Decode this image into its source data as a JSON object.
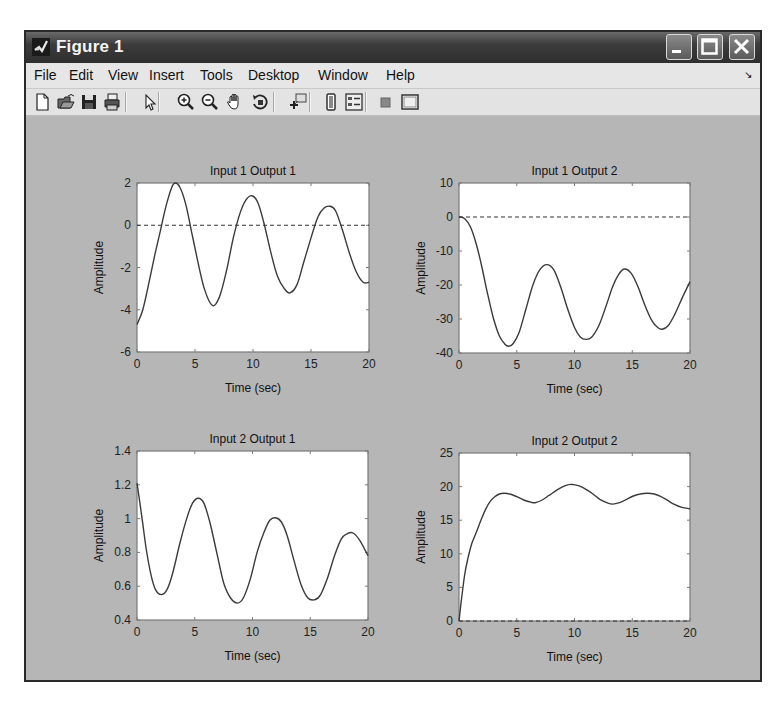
{
  "window": {
    "title": "Figure 1",
    "buttons": {
      "minimize": "minimize",
      "maximize": "maximize",
      "close": "close"
    }
  },
  "menubar": {
    "items": [
      {
        "label": "File",
        "x": 10
      },
      {
        "label": "Edit",
        "x": 45
      },
      {
        "label": "View",
        "x": 84
      },
      {
        "label": "Insert",
        "x": 125
      },
      {
        "label": "Tools",
        "x": 176
      },
      {
        "label": "Desktop",
        "x": 224
      },
      {
        "label": "Window",
        "x": 294
      },
      {
        "label": "Help",
        "x": 362
      }
    ]
  },
  "toolbar": {
    "buttons": [
      {
        "name": "new-figure-icon",
        "x": 6
      },
      {
        "name": "open-file-icon",
        "x": 30
      },
      {
        "name": "save-figure-icon",
        "x": 53
      },
      {
        "name": "print-figure-icon",
        "x": 76
      },
      {
        "sep": true,
        "x": 99
      },
      {
        "name": "edit-plot-pointer-icon",
        "x": 114
      },
      {
        "sep": true,
        "x": 132
      },
      {
        "name": "zoom-in-icon",
        "x": 150
      },
      {
        "name": "zoom-out-icon",
        "x": 174
      },
      {
        "name": "pan-hand-icon",
        "x": 199
      },
      {
        "name": "rotate-3d-icon",
        "x": 224
      },
      {
        "sep": true,
        "x": 247
      },
      {
        "name": "data-cursor-icon",
        "x": 262
      },
      {
        "sep": true,
        "x": 283
      },
      {
        "name": "insert-colorbar-icon",
        "x": 295
      },
      {
        "name": "insert-legend-icon",
        "x": 318
      },
      {
        "sep": true,
        "x": 339
      },
      {
        "name": "hide-plot-tools-icon",
        "x": 350
      },
      {
        "name": "show-plot-tools-icon",
        "x": 374
      }
    ]
  },
  "colors": {
    "figure_bg": "#b6b6b6",
    "axes_bg": "#ffffff",
    "axes_border": "#7a7a7a",
    "line": "#3a3a3a",
    "dashed": "#333333"
  },
  "chart_data": [
    {
      "type": "line",
      "title": "Input 1 Output 1",
      "xlabel": "Time (sec)",
      "ylabel": "Amplitude",
      "xlim": [
        0,
        20
      ],
      "ylim": [
        -6,
        2
      ],
      "xticks": [
        0,
        5,
        10,
        15,
        20
      ],
      "yticks": [
        -6,
        -4,
        -2,
        0,
        2
      ],
      "grid": false,
      "reference_line": {
        "y": 0,
        "style": "dashed"
      },
      "box": {
        "left": 137,
        "top": 183,
        "right": 369,
        "bottom": 352
      },
      "series": [
        {
          "name": "response",
          "x": [
            0,
            0.5,
            1,
            1.5,
            2,
            2.5,
            3,
            3.3,
            3.7,
            4.2,
            4.7,
            5.2,
            5.8,
            6.5,
            7.1,
            7.7,
            8.3,
            8.9,
            9.4,
            9.9,
            10.4,
            10.9,
            11.5,
            12.1,
            12.7,
            13.2,
            13.8,
            14.4,
            15.0,
            15.6,
            16.1,
            16.6,
            17.1,
            17.7,
            18.3,
            18.9,
            19.5,
            20
          ],
          "y": [
            -4.7,
            -4.0,
            -2.8,
            -1.5,
            -0.3,
            0.9,
            1.8,
            2.0,
            1.8,
            1.0,
            -0.3,
            -1.6,
            -3.0,
            -3.8,
            -3.4,
            -2.2,
            -0.6,
            0.6,
            1.2,
            1.4,
            1.1,
            0.2,
            -1.2,
            -2.4,
            -3.0,
            -3.2,
            -2.8,
            -1.7,
            -0.6,
            0.4,
            0.8,
            0.9,
            0.7,
            -0.2,
            -1.3,
            -2.2,
            -2.7,
            -2.7
          ]
        }
      ]
    },
    {
      "type": "line",
      "title": "Input 1 Output 2",
      "xlabel": "Time (sec)",
      "ylabel": "Amplitude",
      "xlim": [
        0,
        20
      ],
      "ylim": [
        -40,
        10
      ],
      "xticks": [
        0,
        5,
        10,
        15,
        20
      ],
      "yticks": [
        -40,
        -30,
        -20,
        -10,
        0,
        10
      ],
      "grid": false,
      "reference_line": {
        "y": 0,
        "style": "dashed"
      },
      "box": {
        "left": 459,
        "top": 183,
        "right": 690,
        "bottom": 353
      },
      "series": [
        {
          "name": "response",
          "x": [
            0,
            0.5,
            1,
            1.5,
            2,
            2.5,
            3,
            3.5,
            4,
            4.3,
            4.7,
            5.2,
            5.8,
            6.4,
            7.0,
            7.6,
            8.2,
            8.8,
            9.4,
            10.0,
            10.5,
            11.0,
            11.5,
            12.1,
            12.7,
            13.3,
            13.8,
            14.3,
            14.9,
            15.5,
            16.1,
            16.7,
            17.2,
            17.6,
            18.1,
            18.7,
            19.3,
            20
          ],
          "y": [
            0,
            -0.5,
            -3,
            -8,
            -15,
            -23,
            -30,
            -35,
            -37.5,
            -38,
            -37.2,
            -34,
            -27,
            -20,
            -15.5,
            -14,
            -15.5,
            -20.5,
            -27,
            -32.5,
            -35.3,
            -36,
            -35.3,
            -32,
            -26.5,
            -20.5,
            -17,
            -15.3,
            -16.5,
            -20.5,
            -26,
            -30.5,
            -32.5,
            -33,
            -32,
            -28.5,
            -24,
            -19
          ]
        }
      ]
    },
    {
      "type": "line",
      "title": "Input 2 Output 1",
      "xlabel": "Time (sec)",
      "ylabel": "Amplitude",
      "xlim": [
        0,
        20
      ],
      "ylim": [
        0.4,
        1.4
      ],
      "xticks": [
        0,
        5,
        10,
        15,
        20
      ],
      "yticks": [
        0.4,
        0.6,
        0.8,
        1,
        1.2,
        1.4
      ],
      "grid": false,
      "reference_line": {
        "y": 1.0,
        "style": "none"
      },
      "box": {
        "left": 137,
        "top": 451,
        "right": 368,
        "bottom": 620
      },
      "series": [
        {
          "name": "response",
          "x": [
            0,
            0.4,
            0.8,
            1.2,
            1.6,
            2.1,
            2.6,
            3.1,
            3.7,
            4.3,
            4.8,
            5.3,
            5.8,
            6.3,
            6.9,
            7.5,
            8.1,
            8.7,
            9.2,
            9.8,
            10.4,
            11.0,
            11.5,
            12.0,
            12.5,
            13.0,
            13.6,
            14.2,
            14.8,
            15.4,
            15.9,
            16.5,
            17.1,
            17.7,
            18.2,
            18.7,
            19.3,
            20
          ],
          "y": [
            1.21,
            1.02,
            0.82,
            0.67,
            0.58,
            0.55,
            0.58,
            0.68,
            0.85,
            1.0,
            1.09,
            1.12,
            1.09,
            0.98,
            0.8,
            0.62,
            0.53,
            0.5,
            0.53,
            0.64,
            0.8,
            0.92,
            0.99,
            1.005,
            0.98,
            0.9,
            0.75,
            0.61,
            0.53,
            0.52,
            0.55,
            0.65,
            0.78,
            0.88,
            0.91,
            0.915,
            0.87,
            0.78
          ]
        }
      ]
    },
    {
      "type": "line",
      "title": "Input 2 Output 2",
      "xlabel": "Time (sec)",
      "ylabel": "Amplitude",
      "xlim": [
        0,
        20
      ],
      "ylim": [
        0,
        25
      ],
      "xticks": [
        0,
        5,
        10,
        15,
        20
      ],
      "yticks": [
        0,
        5,
        10,
        15,
        20,
        25
      ],
      "grid": false,
      "reference_line": {
        "y": 0,
        "style": "dashed"
      },
      "box": {
        "left": 459,
        "top": 453,
        "right": 690,
        "bottom": 621
      },
      "series": [
        {
          "name": "response",
          "x": [
            0,
            0.2,
            0.5,
            0.8,
            1.1,
            1.5,
            1.9,
            2.3,
            2.7,
            3.1,
            3.5,
            3.9,
            4.4,
            5.0,
            5.6,
            6.2,
            6.6,
            7.2,
            7.8,
            8.4,
            9.0,
            9.5,
            9.9,
            10.4,
            11.0,
            11.6,
            12.2,
            12.8,
            13.3,
            13.9,
            14.5,
            15.1,
            15.7,
            16.3,
            16.9,
            17.5,
            18.1,
            18.7,
            19.3,
            20
          ],
          "y": [
            0,
            3,
            7,
            9.5,
            11.5,
            13.2,
            15,
            16.6,
            17.8,
            18.5,
            18.9,
            19.0,
            18.9,
            18.5,
            18.0,
            17.7,
            17.6,
            18.0,
            18.7,
            19.4,
            20.0,
            20.3,
            20.3,
            20.1,
            19.6,
            18.9,
            18.1,
            17.6,
            17.4,
            17.6,
            18.1,
            18.6,
            18.9,
            19.0,
            18.9,
            18.5,
            17.9,
            17.3,
            16.9,
            16.7
          ]
        }
      ]
    }
  ]
}
